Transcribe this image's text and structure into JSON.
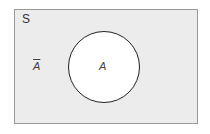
{
  "diagram": {
    "type": "venn",
    "universe_label": "S",
    "set_label": "A",
    "complement_label": "A",
    "complement_notation": "overline",
    "colors": {
      "universe_fill": "#ececec",
      "set_fill": "#ffffff",
      "border": "#222222"
    }
  }
}
